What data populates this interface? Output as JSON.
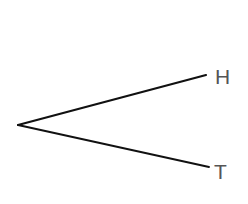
{
  "diagram": {
    "type": "tree-diagram",
    "root": {
      "x": 18,
      "y": 125
    },
    "branches": [
      {
        "label": "H",
        "end": {
          "x": 206,
          "y": 75
        },
        "stroke_width": 2.2
      },
      {
        "label": "T",
        "end": {
          "x": 209,
          "y": 167
        },
        "stroke_width": 1.8
      }
    ],
    "line_color": "#111111",
    "label_color": "#555555",
    "background": "#ffffff"
  }
}
